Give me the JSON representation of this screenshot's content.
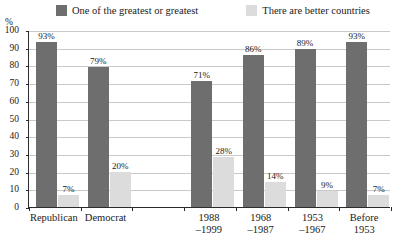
{
  "chart_data": {
    "type": "bar",
    "title": "",
    "xlabel": "",
    "ylabel": "%",
    "ylim": [
      0,
      100
    ],
    "ytick_step": 10,
    "yticks": [
      100,
      90,
      80,
      70,
      60,
      50,
      40,
      30,
      20,
      10,
      0
    ],
    "grid": true,
    "legend_position": "top",
    "categories": [
      "Republican",
      "Democrat",
      "",
      "1988–1999",
      "1968–1987",
      "1953–1967",
      "Before 1953"
    ],
    "series": [
      {
        "name": "One of the greatest or greatest",
        "color": "#6e6e6e",
        "values": [
          93,
          79,
          null,
          71,
          86,
          89,
          93
        ],
        "labels": [
          "93%",
          "79%",
          "",
          "71%",
          "86%",
          "89%",
          "93%"
        ]
      },
      {
        "name": "There are better countries",
        "color": "#dcdcdc",
        "values": [
          7,
          20,
          null,
          28,
          14,
          9,
          7
        ],
        "labels": [
          "7%",
          "20%",
          "",
          "28%",
          "14%",
          "9%",
          "7%"
        ]
      }
    ]
  },
  "legend": {
    "entries": [
      {
        "label": "One of the greatest or greatest",
        "color": "#6e6e6e"
      },
      {
        "label": "There are better countries",
        "color": "#dcdcdc"
      }
    ]
  },
  "axis": {
    "unit_label": "%",
    "y_labels": [
      "100",
      "90",
      "80",
      "70",
      "60",
      "50",
      "40",
      "30",
      "20",
      "10",
      "0"
    ],
    "x_labels": [
      {
        "line1": "Republican",
        "line2": ""
      },
      {
        "line1": "Democrat",
        "line2": ""
      },
      {
        "line1": "",
        "line2": ""
      },
      {
        "line1": "1988",
        "line2": "–1999"
      },
      {
        "line1": "1968",
        "line2": "–1987"
      },
      {
        "line1": "1953",
        "line2": "–1967"
      },
      {
        "line1": "Before",
        "line2": "1953"
      }
    ]
  },
  "colors": {
    "series_dark": "#6e6e6e",
    "series_light": "#dcdcdc",
    "axis": "#2b2b2b",
    "grid": "#c9c9c9",
    "background": "#ffffff"
  }
}
